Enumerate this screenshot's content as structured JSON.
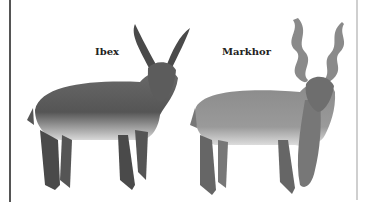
{
  "illustration": {
    "subjects": [
      {
        "name": "Ibex",
        "description": "Pencil drawing of an ibex with long ridged curved horns, facing forward"
      },
      {
        "name": "Markhor",
        "description": "Pencil drawing of a markhor with corkscrew spiral horns and long shaggy beard"
      }
    ],
    "style": "grayscale pencil illustration",
    "colors": {
      "background": "#ffffff",
      "ink": "#3a3a3a",
      "left_border": "#555555",
      "right_border": "#cfcfcf"
    }
  }
}
